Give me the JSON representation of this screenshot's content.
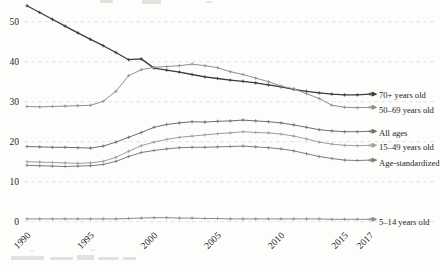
{
  "chart_data": {
    "type": "line",
    "title": "",
    "xlabel": "",
    "ylabel": "",
    "x": [
      1990,
      1991,
      1992,
      1993,
      1994,
      1995,
      1996,
      1997,
      1998,
      1999,
      2000,
      2001,
      2002,
      2003,
      2004,
      2005,
      2006,
      2007,
      2008,
      2009,
      2010,
      2011,
      2012,
      2013,
      2014,
      2015,
      2016,
      2017
    ],
    "x_ticks": [
      1990,
      1995,
      2000,
      2005,
      2010,
      2015,
      2017
    ],
    "x_tick_labels": [
      "1990",
      "1995",
      "2000",
      "2005",
      "2010",
      "2015",
      "2017"
    ],
    "y_ticks": [
      0,
      10,
      20,
      30,
      40,
      50
    ],
    "y_tick_labels": [
      "0",
      "10",
      "20",
      "30",
      "40",
      "50"
    ],
    "xlim": [
      1990,
      2017
    ],
    "ylim": [
      0,
      56
    ],
    "grid": "horizontal dashed",
    "legend_position": "right of line ends with arrow connectors",
    "marker": "plus",
    "gridline_color": "#dcdcdc",
    "text_color": "#1e1e1e",
    "background_color": "#fdfdfc",
    "series": [
      {
        "name": "70plus",
        "label": "70+ years old",
        "color": "#3b3b3b",
        "values": [
          54.0,
          52.3,
          50.6,
          48.9,
          47.2,
          45.6,
          44.0,
          42.3,
          40.5,
          40.7,
          38.4,
          37.9,
          37.4,
          36.8,
          36.2,
          35.8,
          35.4,
          35.1,
          34.7,
          34.2,
          33.7,
          33.1,
          32.6,
          32.2,
          31.9,
          31.7,
          31.7,
          31.9
        ]
      },
      {
        "name": "50-69",
        "label": "50–69 years old",
        "color": "#8f8f8f",
        "values": [
          28.8,
          28.7,
          28.8,
          28.9,
          29.0,
          29.1,
          30.1,
          32.6,
          36.5,
          38.0,
          38.6,
          38.8,
          39.0,
          39.4,
          39.0,
          38.5,
          37.5,
          36.8,
          35.9,
          35.0,
          33.9,
          33.2,
          32.0,
          30.8,
          29.1,
          28.6,
          28.5,
          28.6
        ]
      },
      {
        "name": "all-ages",
        "label": "All ages",
        "color": "#6f6f6f",
        "values": [
          18.8,
          18.7,
          18.6,
          18.6,
          18.5,
          18.4,
          18.9,
          19.9,
          21.1,
          22.3,
          23.6,
          24.3,
          24.7,
          25.0,
          24.9,
          25.1,
          25.2,
          25.4,
          25.2,
          25.0,
          24.7,
          24.2,
          23.6,
          23.0,
          22.7,
          22.5,
          22.5,
          22.6
        ]
      },
      {
        "name": "15-49",
        "label": "15–49 years old",
        "color": "#9e9e9e",
        "values": [
          15.0,
          14.9,
          14.8,
          14.7,
          14.6,
          14.7,
          15.1,
          16.1,
          17.6,
          19.0,
          19.9,
          20.6,
          21.1,
          21.4,
          21.7,
          22.0,
          22.2,
          22.5,
          22.3,
          22.2,
          21.9,
          21.4,
          20.7,
          19.9,
          19.4,
          19.1,
          19.0,
          19.1
        ]
      },
      {
        "name": "age-standardized",
        "label": "Age-standardized",
        "color": "#7d7d7d",
        "values": [
          14.1,
          14.0,
          13.9,
          13.8,
          13.9,
          14.0,
          14.3,
          15.1,
          16.3,
          17.3,
          17.8,
          18.2,
          18.5,
          18.6,
          18.6,
          18.7,
          18.8,
          18.9,
          18.7,
          18.5,
          18.2,
          17.7,
          17.0,
          16.3,
          15.8,
          15.4,
          15.3,
          15.4
        ]
      },
      {
        "name": "5-14",
        "label": "5–14 years old",
        "color": "#8b8b8b",
        "values": [
          0.7,
          0.7,
          0.7,
          0.7,
          0.7,
          0.7,
          0.7,
          0.7,
          0.8,
          0.9,
          1.0,
          1.0,
          0.9,
          0.9,
          0.8,
          0.8,
          0.7,
          0.7,
          0.7,
          0.7,
          0.7,
          0.7,
          0.7,
          0.7,
          0.6,
          0.6,
          0.6,
          0.6
        ]
      }
    ]
  }
}
